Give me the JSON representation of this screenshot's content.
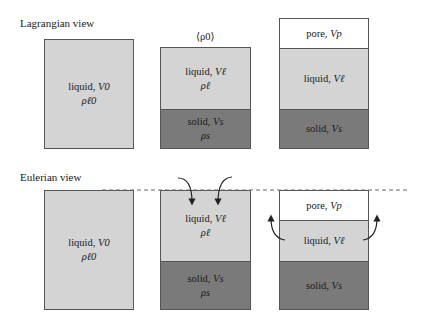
{
  "lagrangian": {
    "label": "Lagrangian view",
    "avg_density_label": "⟨ρ0⟩",
    "box1": {
      "liquid": {
        "name": "liquid,",
        "volume": "V0",
        "density": "ρℓ0"
      }
    },
    "box2": {
      "liquid": {
        "name": "liquid,",
        "volume": "Vℓ",
        "density": "ρℓ"
      },
      "solid": {
        "name": "solid,",
        "volume": "Vs",
        "density": "ρs"
      }
    },
    "box3": {
      "pore": {
        "name": "pore,",
        "volume": "Vp"
      },
      "liquid": {
        "name": "liquid,",
        "volume": "Vℓ"
      },
      "solid": {
        "name": "solid,",
        "volume": "Vs"
      }
    }
  },
  "eulerian": {
    "label": "Eulerian view",
    "box1": {
      "liquid": {
        "name": "liquid,",
        "volume": "V0",
        "density": "ρℓ0"
      }
    },
    "box2": {
      "liquid": {
        "name": "liquid,",
        "volume": "Vℓ",
        "density": "ρℓ"
      },
      "solid": {
        "name": "solid,",
        "volume": "Vs",
        "density": "ρs"
      }
    },
    "box3": {
      "pore": {
        "name": "pore,",
        "volume": "Vp"
      },
      "liquid": {
        "name": "liquid,",
        "volume": "Vℓ"
      },
      "solid": {
        "name": "solid,",
        "volume": "Vs"
      }
    }
  },
  "colors": {
    "liquid": "#d4d4d4",
    "solid": "#7a7a7a",
    "pore": "#ffffff",
    "border": "#555555"
  }
}
